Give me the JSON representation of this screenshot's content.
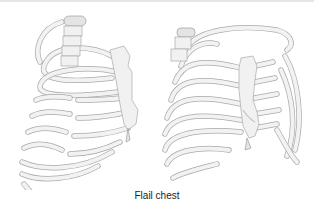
{
  "figure": {
    "caption": "Flail chest",
    "panels": [
      {
        "id": "left",
        "description": "Rib cage, oblique lateral view, showing segmental rib fractures (flail segment)"
      },
      {
        "id": "right",
        "description": "Rib cage, anterior oblique view, showing fractured ribs and sternum"
      }
    ]
  },
  "colors": {
    "background": "#ffffff",
    "bone_fill": "#f1f1f1",
    "bone_outline": "#a9a9a9",
    "caption_text": "#222222"
  }
}
